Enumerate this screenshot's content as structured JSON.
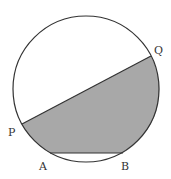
{
  "diagram": {
    "type": "geometry-circle",
    "circle": {
      "cx": 86,
      "cy": 89,
      "r": 73
    },
    "points": {
      "P": {
        "label": "P",
        "x": 22,
        "y": 124,
        "lx": 8,
        "ly": 136
      },
      "Q": {
        "label": "Q",
        "x": 151,
        "y": 56,
        "lx": 154,
        "ly": 54
      },
      "A": {
        "label": "A",
        "x": 50,
        "y": 153,
        "lx": 39,
        "ly": 170
      },
      "B": {
        "label": "B",
        "x": 123,
        "y": 153,
        "lx": 123,
        "ly": 170
      }
    },
    "shaded_region": "Region bounded by chord PQ, arc Q→B, chord BA, and arc A→P",
    "colors": {
      "stroke": "#333333",
      "fill": "#a8a8a8",
      "background": "#ffffff"
    }
  }
}
